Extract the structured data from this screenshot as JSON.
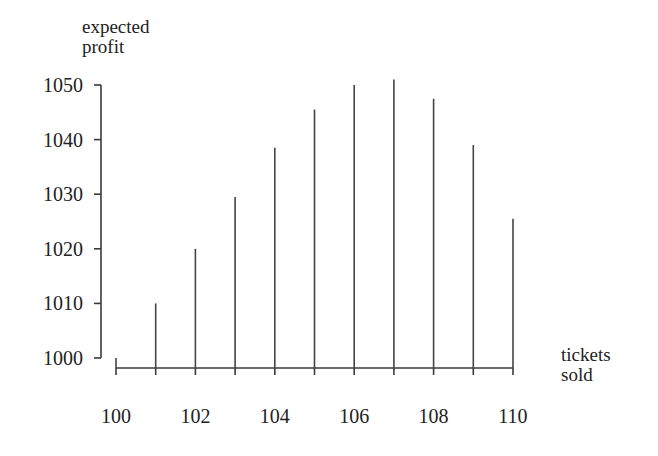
{
  "chart_data": {
    "type": "bar",
    "style": "vertical-lines",
    "title": "",
    "xlabel": "tickets sold",
    "xlabel_lines": [
      "tickets",
      "sold"
    ],
    "ylabel": "expected profit",
    "ylabel_lines": [
      "expected",
      "profit"
    ],
    "categories": [
      100,
      101,
      102,
      103,
      104,
      105,
      106,
      107,
      108,
      109,
      110
    ],
    "values": [
      1000,
      1010,
      1020,
      1029.5,
      1038.5,
      1045.5,
      1050,
      1051,
      1047.5,
      1039,
      1025.5
    ],
    "x_ticks": [
      "100",
      "102",
      "104",
      "106",
      "108",
      "110"
    ],
    "y_ticks": [
      "1000",
      "1010",
      "1020",
      "1030",
      "1040",
      "1050"
    ],
    "ylim": [
      1000,
      1050
    ],
    "xlim": [
      100,
      110
    ],
    "grid": false,
    "legend": null
  }
}
